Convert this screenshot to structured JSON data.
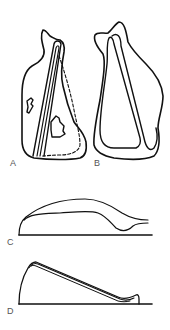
{
  "figure": {
    "panels": [
      {
        "id": "A",
        "label": "A",
        "description": "outline with internal double strut, dashed inner contour and two irregular holes"
      },
      {
        "id": "B",
        "label": "B",
        "description": "outline with internal double-walled triangular loop"
      },
      {
        "id": "C",
        "label": "C",
        "description": "profile: two curves over a baseline"
      },
      {
        "id": "D",
        "label": "D",
        "description": "profile: steep rise then long double-line slope to a small lip over a baseline"
      }
    ],
    "colors": {
      "line": "#111111",
      "label": "#555555",
      "background": "#ffffff"
    }
  }
}
